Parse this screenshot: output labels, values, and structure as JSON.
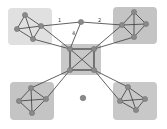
{
  "diagram": {
    "type": "network-graph",
    "colors": {
      "background": "#ffffff",
      "group_light": "#dcdcdc",
      "group_dark": "#c4c4c4",
      "node": "#8a8a8a",
      "edge": "#3a3a3a"
    },
    "groups": [
      {
        "id": "top-left",
        "x": 8,
        "y": 8,
        "w": 44,
        "h": 37,
        "fill": "#e0e0e0"
      },
      {
        "id": "top-right",
        "x": 113,
        "y": 7,
        "w": 44,
        "h": 37,
        "fill": "#c4c4c4"
      },
      {
        "id": "center",
        "x": 61,
        "y": 44,
        "w": 40,
        "h": 31,
        "fill": "#c8c8c8"
      },
      {
        "id": "bottom-left",
        "x": 10,
        "y": 82,
        "w": 44,
        "h": 38,
        "fill": "#c4c4c4"
      },
      {
        "id": "bottom-right",
        "x": 113,
        "y": 82,
        "w": 44,
        "h": 38,
        "fill": "#c8c8c8"
      }
    ],
    "edge_labels": [
      {
        "text": "1",
        "x": 58,
        "y": 22
      },
      {
        "text": "2",
        "x": 98,
        "y": 22
      },
      {
        "text": "4",
        "x": 72,
        "y": 35
      }
    ]
  }
}
